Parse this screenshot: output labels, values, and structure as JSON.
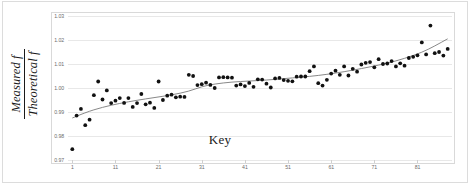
{
  "chart_data": {
    "type": "scatter",
    "title": "",
    "xlabel": "Key",
    "ylabel_numerator": "Measured f",
    "ylabel_denominator": "Theoretical f",
    "xlim": [
      0,
      89
    ],
    "ylim": [
      0.97,
      1.03
    ],
    "grid": true,
    "legend": "none",
    "xticks": [
      1,
      11,
      21,
      31,
      41,
      51,
      61,
      71,
      81
    ],
    "xtick_labels": [
      "1",
      "11",
      "21",
      "31",
      "41",
      "51",
      "61",
      "71",
      "81"
    ],
    "yticks": [
      0.97,
      0.98,
      0.99,
      1.0,
      1.01,
      1.02,
      1.03
    ],
    "ytick_labels": [
      "0.97",
      "0.98",
      "0.99",
      "1.00",
      "1.01",
      "1.02",
      "1.03"
    ],
    "marker": "filled-circle",
    "marker_color": "#111111",
    "trendline_color": "#7b7b7b",
    "x": [
      1,
      2,
      3,
      4,
      5,
      6,
      7,
      8,
      9,
      10,
      11,
      12,
      13,
      14,
      15,
      16,
      17,
      18,
      19,
      20,
      21,
      22,
      23,
      24,
      25,
      26,
      27,
      28,
      29,
      30,
      31,
      32,
      33,
      34,
      35,
      36,
      37,
      38,
      39,
      40,
      41,
      42,
      43,
      44,
      45,
      46,
      47,
      48,
      49,
      50,
      51,
      52,
      53,
      54,
      55,
      56,
      57,
      58,
      59,
      60,
      61,
      62,
      63,
      64,
      65,
      66,
      67,
      68,
      69,
      70,
      71,
      72,
      73,
      74,
      75,
      76,
      77,
      78,
      79,
      80,
      81,
      82,
      83,
      84,
      85,
      86,
      87,
      88
    ],
    "y": [
      0.9745,
      0.9885,
      0.9913,
      0.9845,
      0.9868,
      0.997,
      1.0027,
      0.9952,
      0.999,
      0.9937,
      0.9947,
      0.9958,
      0.9938,
      0.9958,
      0.9921,
      0.9937,
      0.9975,
      0.9932,
      0.9939,
      0.9917,
      1.0027,
      0.995,
      0.9968,
      0.9972,
      0.9961,
      0.9964,
      0.9963,
      1.0055,
      1.005,
      1.0012,
      1.0016,
      1.0022,
      1.0013,
      1.0,
      1.0044,
      1.0045,
      1.0044,
      1.0043,
      1.001,
      1.0015,
      1.0008,
      1.0021,
      1.0005,
      1.0036,
      1.0035,
      1.0018,
      1.0002,
      1.004,
      1.0042,
      1.0033,
      1.003,
      1.0028,
      1.0047,
      1.0048,
      1.0048,
      1.007,
      1.009,
      1.002,
      1.001,
      1.0034,
      1.006,
      1.0072,
      1.0055,
      1.009,
      1.0052,
      1.008,
      1.0068,
      1.0098,
      1.0105,
      1.0108,
      1.0086,
      1.012,
      1.01,
      1.0102,
      1.0112,
      1.009,
      1.0103,
      1.0093,
      1.0125,
      1.013,
      1.0136,
      1.019,
      1.014,
      1.026,
      1.0145,
      1.015,
      1.0135,
      1.0163
    ],
    "trend_points": [
      [
        1,
        0.9875
      ],
      [
        4,
        0.9898
      ],
      [
        8,
        0.992
      ],
      [
        12,
        0.9936
      ],
      [
        16,
        0.9949
      ],
      [
        20,
        0.996
      ],
      [
        24,
        0.9971
      ],
      [
        28,
        0.9986
      ],
      [
        31,
        1.0006
      ],
      [
        34,
        1.0017
      ],
      [
        38,
        1.0025
      ],
      [
        42,
        1.0029
      ],
      [
        46,
        1.0033
      ],
      [
        50,
        1.0039
      ],
      [
        54,
        1.0045
      ],
      [
        58,
        1.0052
      ],
      [
        62,
        1.0062
      ],
      [
        66,
        1.0074
      ],
      [
        70,
        1.0088
      ],
      [
        74,
        1.0103
      ],
      [
        78,
        1.0123
      ],
      [
        82,
        1.0148
      ],
      [
        85,
        1.0175
      ],
      [
        88,
        1.0205
      ]
    ]
  },
  "axis": {
    "x_title": "Key",
    "y_title_numerator": "Measured f",
    "y_title_denominator": "Theoretical f"
  }
}
